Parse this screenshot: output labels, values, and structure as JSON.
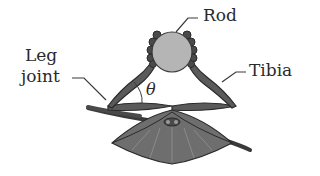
{
  "diagram": {
    "labels": {
      "rod": "Rod",
      "leg_joint_line1": "Leg",
      "leg_joint_line2": "joint",
      "tibia": "Tibia",
      "angle": "θ"
    },
    "colors": {
      "rod_fill": "#b5b5b5",
      "body_fill": "#6e6e6e",
      "leg_fill": "#5a5a5a",
      "outline": "#2a2a2a",
      "leader_line": "#3a3a3a"
    }
  }
}
